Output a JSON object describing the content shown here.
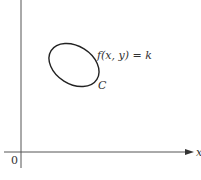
{
  "diagram": {
    "type": "level-curve",
    "axes": {
      "x_label": "x",
      "origin_label": "0",
      "y_label_visible": false
    },
    "curve": {
      "name": "C",
      "equation": "f(x, y) = k",
      "shape": "closed tilted ellipse"
    },
    "colors": {
      "stroke": "#333333",
      "background": "#ffffff"
    }
  }
}
